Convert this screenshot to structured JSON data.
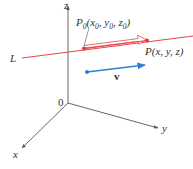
{
  "figure": {
    "axes": {
      "origin_label": "0",
      "x_label": "x",
      "y_label": "y",
      "z_label": "z"
    },
    "line": {
      "label": "L",
      "color": "#e8474a"
    },
    "points": {
      "p0": {
        "name": "P",
        "sub": "0",
        "coords_text": "(x",
        "coords": [
          "x",
          "0",
          "y",
          "0",
          "z",
          "0"
        ],
        "label_full": "P0(x0, y0, z0)"
      },
      "p": {
        "label_full": "P(x, y, z)",
        "name": "P",
        "coords_text": "(x, y, z)"
      }
    },
    "vector_v": {
      "label": "v",
      "color": "#2f7fd1"
    },
    "displacement_arrow": {
      "color": "#e8474a",
      "style": "hollow"
    },
    "colors": {
      "axis": "#555555",
      "line": "#e8474a",
      "vector": "#2f7fd1",
      "point": "#d93a3c"
    }
  }
}
